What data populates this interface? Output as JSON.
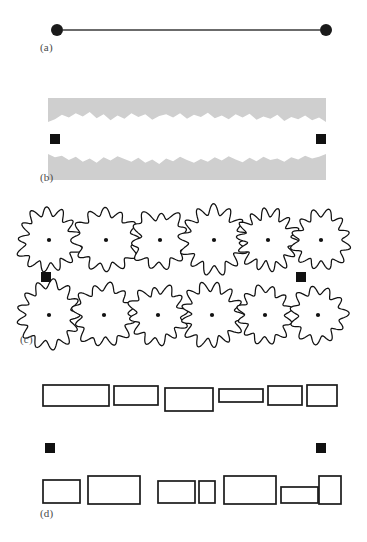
{
  "figure": {
    "background_color": "#ffffff",
    "width": 367,
    "height": 542
  },
  "colors": {
    "marker_black": "#111111",
    "line_gray": "#3a3a3a",
    "band_gray": "#cfcfcf",
    "outline_black": "#1a1a1a",
    "label_gray": "#4a4a4a",
    "fill_white": "#ffffff"
  },
  "panels": [
    {
      "id": "a",
      "label": "(a)",
      "description": "Two filled circular endpoint markers joined by a straight horizontal line",
      "marker_shape": "circle",
      "marker_count": 2,
      "marker_radius": 6,
      "markers": [
        {
          "cx": 57,
          "cy": 30
        },
        {
          "cx": 326,
          "cy": 30
        }
      ],
      "connector": {
        "x1": 63,
        "y1": 30,
        "x2": 320,
        "y2": 30,
        "stroke_width": 1.6
      }
    },
    {
      "id": "b",
      "label": "(b)",
      "description": "Two gray bands with irregular rough edges facing a central gap; square markers between them",
      "marker_shape": "square",
      "marker_count": 2,
      "marker_size": 10,
      "markers": [
        {
          "x": 50,
          "y": 46
        },
        {
          "x": 316,
          "y": 46
        }
      ],
      "bands": [
        {
          "name": "upper-band",
          "x": 48,
          "y": 10,
          "width": 278,
          "height": 24,
          "rough_edge": "bottom",
          "edge_profile": [
            0,
            5,
            13,
            8,
            16,
            10,
            18,
            7,
            14,
            3,
            12,
            6,
            16,
            9,
            14,
            4,
            11,
            14,
            8,
            16,
            6,
            13,
            9,
            17,
            7,
            12,
            5,
            14,
            8,
            15,
            4,
            10,
            6,
            13,
            2,
            9,
            5,
            12,
            3,
            8,
            0
          ]
        },
        {
          "name": "lower-band",
          "x": 48,
          "y": 66,
          "width": 278,
          "height": 26,
          "rough_edge": "top",
          "edge_profile": [
            0,
            6,
            3,
            11,
            5,
            14,
            8,
            16,
            6,
            12,
            4,
            9,
            14,
            7,
            16,
            10,
            18,
            8,
            13,
            5,
            11,
            16,
            9,
            14,
            6,
            12,
            4,
            10,
            15,
            7,
            13,
            5,
            11,
            8,
            14,
            6,
            10,
            3,
            8,
            5,
            0
          ]
        }
      ]
    },
    {
      "id": "c",
      "label": "(c)",
      "description": "Two rows of six irregular lobed blob outlines, each with a small black center dot; square markers between the rows",
      "marker_shape": "square",
      "marker_count": 2,
      "marker_size": 10,
      "markers": [
        {
          "x": 41,
          "y": 76
        },
        {
          "x": 296,
          "y": 76
        }
      ],
      "blob_rows": [
        {
          "name": "top-row",
          "cy": 44,
          "blobs": [
            {
              "cx": 49,
              "radius": 28,
              "lobes": 13,
              "amplitude": 0.17,
              "seed": 11
            },
            {
              "cx": 106,
              "radius": 29,
              "lobes": 12,
              "amplitude": 0.15,
              "seed": 27
            },
            {
              "cx": 160,
              "radius": 26,
              "lobes": 11,
              "amplitude": 0.16,
              "seed": 43
            },
            {
              "cx": 214,
              "radius": 30,
              "lobes": 13,
              "amplitude": 0.18,
              "seed": 58
            },
            {
              "cx": 268,
              "radius": 27,
              "lobes": 14,
              "amplitude": 0.19,
              "seed": 71
            },
            {
              "cx": 321,
              "radius": 26,
              "lobes": 12,
              "amplitude": 0.17,
              "seed": 89
            }
          ]
        },
        {
          "name": "bottom-row",
          "cy": 119,
          "blobs": [
            {
              "cx": 49,
              "radius": 29,
              "lobes": 13,
              "amplitude": 0.16,
              "seed": 101
            },
            {
              "cx": 104,
              "radius": 28,
              "lobes": 12,
              "amplitude": 0.15,
              "seed": 117
            },
            {
              "cx": 158,
              "radius": 26,
              "lobes": 12,
              "amplitude": 0.17,
              "seed": 133
            },
            {
              "cx": 212,
              "radius": 28,
              "lobes": 13,
              "amplitude": 0.18,
              "seed": 149
            },
            {
              "cx": 265,
              "radius": 25,
              "lobes": 12,
              "amplitude": 0.16,
              "seed": 163
            },
            {
              "cx": 318,
              "radius": 25,
              "lobes": 11,
              "amplitude": 0.17,
              "seed": 179
            }
          ]
        }
      ],
      "center_dot_radius": 2.1
    },
    {
      "id": "d",
      "label": "(d)",
      "description": "Two rows of open rectangles of varying width and height; square markers between the rows",
      "marker_shape": "square",
      "marker_count": 2,
      "marker_size": 10,
      "markers": [
        {
          "x": 45,
          "y": 83
        },
        {
          "x": 316,
          "y": 83
        }
      ],
      "rect_rows": [
        {
          "name": "top-row",
          "rects": [
            {
              "x": 43,
              "y": 25,
              "width": 66,
              "height": 21
            },
            {
              "x": 114,
              "y": 26,
              "width": 44,
              "height": 19
            },
            {
              "x": 165,
              "y": 28,
              "width": 48,
              "height": 23
            },
            {
              "x": 219,
              "y": 29,
              "width": 44,
              "height": 13
            },
            {
              "x": 268,
              "y": 26,
              "width": 34,
              "height": 19
            },
            {
              "x": 307,
              "y": 25,
              "width": 30,
              "height": 21
            }
          ]
        },
        {
          "name": "bottom-row",
          "rects": [
            {
              "x": 43,
              "y": 120,
              "width": 37,
              "height": 23
            },
            {
              "x": 88,
              "y": 116,
              "width": 52,
              "height": 28
            },
            {
              "x": 158,
              "y": 121,
              "width": 37,
              "height": 22
            },
            {
              "x": 199,
              "y": 121,
              "width": 16,
              "height": 22
            },
            {
              "x": 224,
              "y": 116,
              "width": 52,
              "height": 28
            },
            {
              "x": 281,
              "y": 127,
              "width": 37,
              "height": 16
            },
            {
              "x": 319,
              "y": 116,
              "width": 22,
              "height": 28
            }
          ]
        }
      ]
    }
  ]
}
